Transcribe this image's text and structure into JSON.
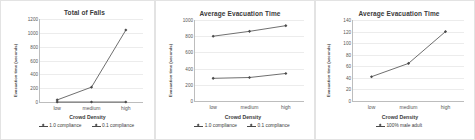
{
  "figure": {
    "panel_count": 3,
    "axis_color": "#bdbdbd",
    "grid_color": "#ececec",
    "series_color": "#4a4a4a"
  },
  "panels": [
    {
      "title": "Total of Falls",
      "ylabel": "Evacuation time (seconds)",
      "xlabel": "Crowd Density",
      "yticks": [
        "0",
        "200",
        "400",
        "600",
        "800",
        "1000",
        "1200"
      ],
      "xticks": [
        "low",
        "medium",
        "high"
      ],
      "legend": [
        "1.0 compliance",
        "0.1 compliance"
      ]
    },
    {
      "title": "Average Evacuation Time",
      "ylabel": "Evacuation time (seconds)",
      "xlabel": "Crowd Density",
      "yticks": [
        "0",
        "200",
        "400",
        "600",
        "800",
        "1000"
      ],
      "xticks": [
        "low",
        "medium",
        "high"
      ],
      "legend": [
        "1.0 compliance",
        "0.1 compliance"
      ]
    },
    {
      "title": "Average Evacuation Time",
      "ylabel": "Evacuation time (seconds)",
      "xlabel": "Crowd Density",
      "yticks": [
        "0",
        "20",
        "40",
        "60",
        "80",
        "100",
        "120",
        "140"
      ],
      "xticks": [
        "low",
        "medium",
        "high"
      ],
      "legend": [
        "100% male adult"
      ]
    }
  ],
  "chart_data": [
    {
      "type": "line",
      "title": "Total of Falls",
      "xlabel": "Crowd Density",
      "ylabel": "Evacuation time (seconds)",
      "categories": [
        "low",
        "medium",
        "high"
      ],
      "ylim": [
        0,
        1200
      ],
      "ytick_step": 200,
      "grid": true,
      "legend_position": "bottom",
      "series": [
        {
          "name": "1.0 compliance",
          "values": [
            0,
            0,
            0
          ]
        },
        {
          "name": "0.1 compliance",
          "values": [
            30,
            215,
            1040
          ]
        }
      ]
    },
    {
      "type": "line",
      "title": "Average Evacuation Time",
      "xlabel": "Crowd Density",
      "ylabel": "Evacuation time (seconds)",
      "categories": [
        "low",
        "medium",
        "high"
      ],
      "ylim": [
        0,
        1000
      ],
      "ytick_step": 200,
      "grid": true,
      "legend_position": "bottom",
      "series": [
        {
          "name": "1.0 compliance",
          "values": [
            280,
            290,
            340
          ]
        },
        {
          "name": "0.1 compliance",
          "values": [
            800,
            860,
            930
          ]
        }
      ]
    },
    {
      "type": "line",
      "title": "Average Evacuation Time",
      "xlabel": "Crowd Density",
      "ylabel": "Evacuation time (seconds)",
      "categories": [
        "low",
        "medium",
        "high"
      ],
      "ylim": [
        0,
        140
      ],
      "ytick_step": 20,
      "grid": true,
      "legend_position": "bottom",
      "series": [
        {
          "name": "100% male adult",
          "values": [
            42,
            65,
            120
          ]
        }
      ]
    }
  ]
}
